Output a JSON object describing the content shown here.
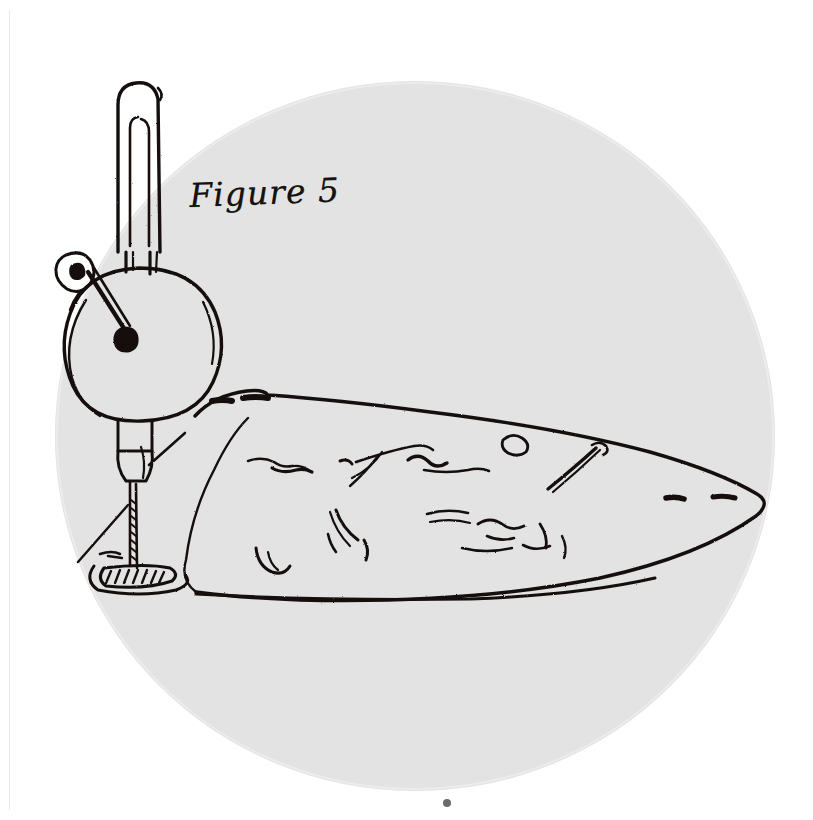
{
  "document": {
    "kind": "scanned-handwritten-sketch",
    "caption": "Figure 5",
    "background_color": "#ffffff",
    "plate_color": "#e7e7e7",
    "ink_color": "#141110"
  },
  "plate": {
    "name": "circular-photographic-plate",
    "shape": "circle",
    "center_x": 415,
    "center_y": 436,
    "radius_x": 360,
    "radius_y": 355,
    "fill": "#e7e7e7"
  },
  "subjects": [
    {
      "id": "tuning-fork",
      "label": "tuning fork",
      "description": "Two-tined tuning fork with rounded tip and central slot, standing vertically."
    },
    {
      "id": "resonator-disc",
      "label": "resonator disc",
      "description": "Circular disc beneath the fork with an interior arc and a dark hub."
    },
    {
      "id": "pivot-eyelet",
      "label": "pivot eyelet",
      "description": "Small rounded eyelet at upper left joined to the hub by a straight rod."
    },
    {
      "id": "pivot-rod",
      "label": "pivot rod",
      "description": "Straight tapered rod from the eyelet down to the dark hub blob."
    },
    {
      "id": "collar",
      "label": "collar",
      "description": "Rectangular collar and tapered funnel below the disc."
    },
    {
      "id": "stylus",
      "label": "stylus needle",
      "description": "Thin serrated vertical needle descending from the collar to the hatched pad."
    },
    {
      "id": "hatched-pad",
      "label": "hatched pad",
      "description": "Elongated oval pad with diagonal hatching at the lower left."
    },
    {
      "id": "specimen",
      "label": "leaf-shaped specimen",
      "description": "Large flattened boat or leaf shaped body tapering to a rounded point at the right, covered with sketchy interior strokes, two dark dashes on the upper left shoulder and two dark dashes near the right tip."
    },
    {
      "id": "ink-dot",
      "label": "ink dot",
      "description": "Small stray ink dot below the plate."
    }
  ],
  "marks": {
    "shoulder_dashes": 2,
    "tip_dashes": 2,
    "hatch_lines": 11
  }
}
